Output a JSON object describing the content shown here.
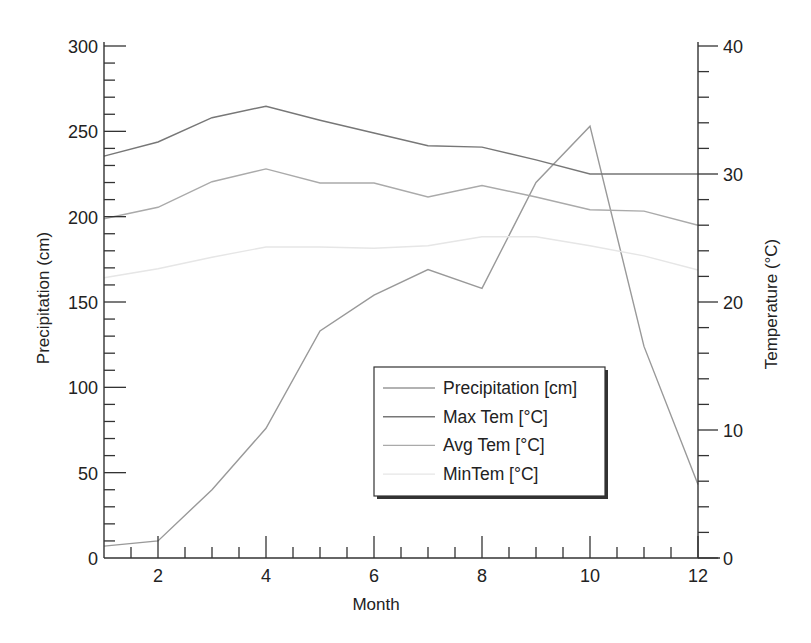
{
  "chart_data": {
    "type": "line",
    "title": "",
    "xlabel": "Month",
    "ylabel": "Precipitation (cm)",
    "y2label": "Temperature (°C)",
    "xlim": [
      1,
      12
    ],
    "ylim": [
      0,
      300
    ],
    "y2lim": [
      0,
      40
    ],
    "x_ticks": [
      2,
      4,
      6,
      8,
      10,
      12
    ],
    "y_ticks": [
      0,
      50,
      100,
      150,
      200,
      250,
      300
    ],
    "y2_ticks": [
      0,
      10,
      20,
      30,
      40
    ],
    "grid": false,
    "legend_position": "inside-lower-right",
    "x": [
      1,
      2,
      3,
      4,
      5,
      6,
      7,
      8,
      9,
      10,
      11,
      12
    ],
    "series": [
      {
        "name": "Precipitation [cm]",
        "axis": "left",
        "color": "#999999",
        "values": [
          7,
          10,
          40,
          76,
          133,
          154,
          169,
          158,
          220,
          253,
          124,
          43
        ]
      },
      {
        "name": "Max Tem [°C]",
        "axis": "right",
        "color": "#777777",
        "values": [
          31.4,
          32.5,
          34.4,
          35.3,
          34.2,
          33.2,
          32.2,
          32.1,
          31.1,
          30.0,
          30.0,
          30.0
        ]
      },
      {
        "name": "Avg Tem [°C]",
        "axis": "right",
        "color": "#aaaaaa",
        "values": [
          26.5,
          27.4,
          29.4,
          30.4,
          29.3,
          29.3,
          28.2,
          29.1,
          28.2,
          27.2,
          27.1,
          26.0
        ]
      },
      {
        "name": "MinTem [°C]",
        "axis": "right",
        "color": "#e6e6e6",
        "values": [
          21.9,
          22.6,
          23.5,
          24.3,
          24.3,
          24.2,
          24.4,
          25.1,
          25.1,
          24.4,
          23.6,
          22.5
        ]
      }
    ]
  }
}
